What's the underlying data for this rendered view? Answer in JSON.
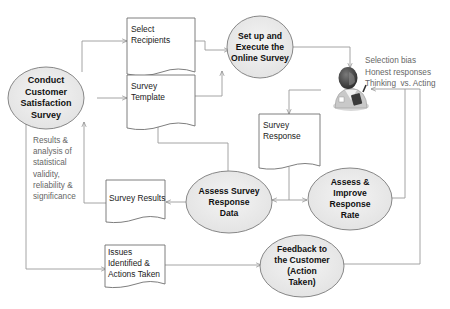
{
  "diagram": {
    "colors": {
      "ellipse_fill": "#ececec",
      "ellipse_stroke": "#7a7a7a",
      "doc_fill": "#ffffff",
      "doc_stroke": "#6f6f6f",
      "connector": "#9a9a9a",
      "note_text": "#666666"
    },
    "processes": {
      "conduct_survey": {
        "lines": [
          "Conduct",
          "Customer",
          "Satisfaction",
          "Survey"
        ]
      },
      "setup_execute": {
        "lines": [
          "Set up and",
          "Execute the",
          "Online Survey"
        ]
      },
      "assess_data": {
        "lines": [
          "Assess Survey",
          "Response",
          "Data"
        ]
      },
      "assess_rate": {
        "lines": [
          "Assess &",
          "Improve",
          "Response",
          "Rate"
        ]
      },
      "feedback": {
        "lines": [
          "Feedback to",
          "the Customer",
          "(Action",
          "Taken)"
        ]
      }
    },
    "documents": {
      "select_recipients": {
        "lines": [
          "Select",
          "Recipients"
        ]
      },
      "survey_template": {
        "lines": [
          "Survey",
          "Template"
        ]
      },
      "survey_response": {
        "lines": [
          "Survey",
          "Response"
        ]
      },
      "survey_results": {
        "lines": [
          "Survey Results"
        ]
      },
      "issues_actions": {
        "lines": [
          "Issues",
          "Identified &",
          "Actions Taken"
        ]
      }
    },
    "notes": {
      "respondent_concerns": {
        "lines": [
          "Selection bias",
          "Honest responses",
          "Thinking  vs. Acting"
        ]
      },
      "results_analysis": {
        "lines": [
          "Results &",
          "analysis of",
          "statistical",
          "validity,",
          "reliability &",
          "significance"
        ]
      }
    },
    "actor": {
      "icon": "respondent-person-icon",
      "label": "Survey respondent"
    }
  }
}
